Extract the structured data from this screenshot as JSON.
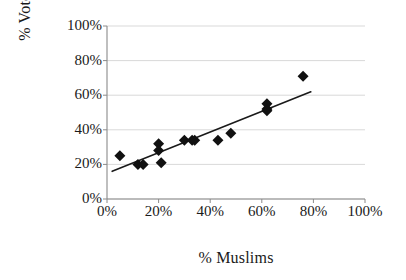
{
  "chart_data": {
    "type": "scatter",
    "title": "",
    "xlabel": "% Muslims",
    "ylabel": "% Votes",
    "xlim": [
      0,
      100
    ],
    "ylim": [
      0,
      100
    ],
    "grid": true,
    "legend": false,
    "x_ticks": [
      "0%",
      "20%",
      "40%",
      "60%",
      "80%",
      "100%"
    ],
    "x_tick_values": [
      0,
      20,
      40,
      60,
      80,
      100
    ],
    "y_ticks": [
      "0%",
      "20%",
      "40%",
      "60%",
      "80%",
      "100%"
    ],
    "y_tick_values": [
      0,
      20,
      40,
      60,
      80,
      100
    ],
    "marker": "diamond",
    "marker_color": "#111111",
    "marker_size": 11,
    "series": [
      {
        "name": "Constituencies",
        "points": [
          {
            "x": 5,
            "y": 25
          },
          {
            "x": 12,
            "y": 20
          },
          {
            "x": 14,
            "y": 20
          },
          {
            "x": 20,
            "y": 32
          },
          {
            "x": 20,
            "y": 28
          },
          {
            "x": 21,
            "y": 21
          },
          {
            "x": 30,
            "y": 34
          },
          {
            "x": 33,
            "y": 34
          },
          {
            "x": 34,
            "y": 34
          },
          {
            "x": 43,
            "y": 34
          },
          {
            "x": 48,
            "y": 38
          },
          {
            "x": 62,
            "y": 55
          },
          {
            "x": 62,
            "y": 52
          },
          {
            "x": 62,
            "y": 51
          },
          {
            "x": 76,
            "y": 71
          }
        ]
      }
    ],
    "trendline": {
      "type": "linear",
      "x_start": 2,
      "y_start": 16,
      "x_end": 79,
      "y_end": 62,
      "color": "#1a1a1a",
      "width": 1.6
    }
  },
  "axes": {
    "y_title": "% Votes",
    "x_title": "% Muslims"
  }
}
